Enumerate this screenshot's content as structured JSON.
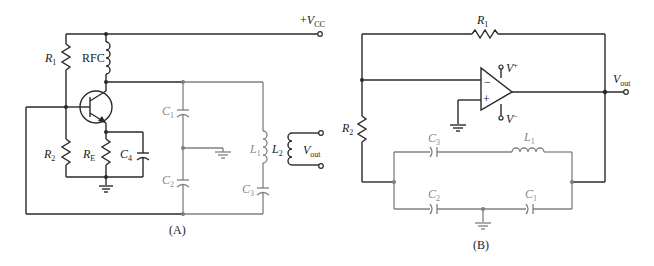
{
  "circuit_a": {
    "caption": "(A)",
    "supply": {
      "prefix": "+",
      "symbol": "V",
      "sub": "CC"
    },
    "components": {
      "r1": {
        "letter": "R",
        "sub": "1"
      },
      "rfc": {
        "text": "RFC"
      },
      "r2": {
        "letter": "R",
        "sub": "2"
      },
      "re": {
        "letter": "R",
        "sub": "E"
      },
      "c4": {
        "letter": "C",
        "sub": "4"
      },
      "c1": {
        "letter": "C",
        "sub": "1"
      },
      "c2": {
        "letter": "C",
        "sub": "2"
      },
      "c3": {
        "letter": "C",
        "sub": "3"
      },
      "l1": {
        "letter": "L",
        "sub": "1"
      },
      "l2": {
        "letter": "L",
        "sub": "2"
      }
    },
    "output": {
      "symbol": "V",
      "sub": "out"
    }
  },
  "circuit_b": {
    "caption": "(B)",
    "components": {
      "r1": {
        "letter": "R",
        "sub": "1"
      },
      "r2": {
        "letter": "R",
        "sub": "2"
      },
      "c1": {
        "letter": "C",
        "sub": "1"
      },
      "c2": {
        "letter": "C",
        "sub": "2"
      },
      "c3": {
        "letter": "C",
        "sub": "3"
      },
      "l1": {
        "letter": "L",
        "sub": "1"
      }
    },
    "opamp": {
      "inverting": "−",
      "noninverting": "+",
      "vplus": {
        "symbol": "V",
        "sup": "+"
      },
      "vminus": {
        "symbol": "V",
        "sup": "−"
      }
    },
    "output": {
      "symbol": "V",
      "sub": "out"
    }
  }
}
